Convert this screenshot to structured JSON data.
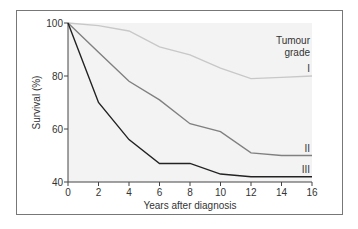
{
  "chart_data": {
    "type": "line",
    "title": "",
    "xlabel": "Years after diagnosis",
    "ylabel": "Survival (%)",
    "xlim": [
      0,
      16
    ],
    "ylim": [
      40,
      100
    ],
    "x_ticks": [
      "0",
      "2",
      "4",
      "6",
      "8",
      "10",
      "12",
      "14",
      "16"
    ],
    "y_ticks": [
      "40",
      "60",
      "80",
      "100"
    ],
    "grid": false,
    "legend_title": "Tumour grade",
    "x": [
      0,
      2,
      4,
      6,
      8,
      10,
      12,
      14,
      16
    ],
    "series": [
      {
        "name": "I",
        "color": "#c8c8c8",
        "values": [
          100,
          99,
          97,
          91,
          88,
          83,
          79,
          79.5,
          80
        ]
      },
      {
        "name": "II",
        "color": "#808080",
        "values": [
          100,
          89,
          78,
          71,
          62,
          59,
          51,
          50,
          50
        ]
      },
      {
        "name": "III",
        "color": "#222222",
        "values": [
          100,
          70,
          56,
          47,
          47,
          43,
          42,
          42,
          42
        ]
      }
    ]
  },
  "labels": {
    "legend_line1": "Tumour",
    "legend_line2": "grade"
  }
}
